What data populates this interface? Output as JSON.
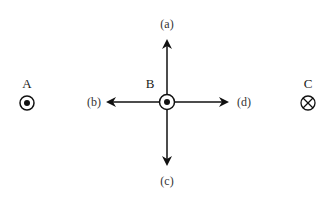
{
  "wires": [
    {
      "id": "A",
      "label": "A",
      "current": "out-of-page",
      "symbol": "dot-icon"
    },
    {
      "id": "B",
      "label": "B",
      "current": "out-of-page",
      "symbol": "dot-icon"
    },
    {
      "id": "C",
      "label": "C",
      "current": "into-page",
      "symbol": "cross-icon"
    }
  ],
  "directions": {
    "a": "(a)",
    "b": "(b)",
    "c": "(c)",
    "d": "(d)"
  },
  "colors": {
    "stroke": "#111111",
    "background": "#ffffff"
  }
}
